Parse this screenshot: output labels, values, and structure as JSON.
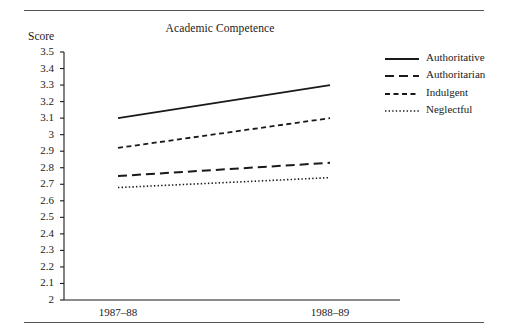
{
  "figure": {
    "title": "Academic Competence",
    "y_axis_name": "Score"
  },
  "chart_data": {
    "type": "line",
    "title": "Academic Competence",
    "xlabel": "",
    "ylabel": "Score",
    "categories": [
      "1987–88",
      "1988–89"
    ],
    "x": [
      0,
      1
    ],
    "ylim": [
      2,
      3.5
    ],
    "yticks": [
      "3.5",
      "3.4",
      "3.3",
      "3.2",
      "3.1",
      "3",
      "2.9",
      "2.8",
      "2.7",
      "2.6",
      "2.5",
      "2.4",
      "2.3",
      "2.2",
      "2.1",
      "2"
    ],
    "ytick_values": [
      3.5,
      3.4,
      3.3,
      3.2,
      3.1,
      3.0,
      2.9,
      2.8,
      2.7,
      2.6,
      2.5,
      2.4,
      2.3,
      2.2,
      2.1,
      2.0
    ],
    "grid": false,
    "legend_position": "right",
    "series": [
      {
        "name": "Authoritative",
        "values": [
          3.1,
          3.3
        ],
        "style": "solid",
        "color": "#1a1a1a"
      },
      {
        "name": "Authoritarian",
        "values": [
          2.75,
          2.83
        ],
        "style": "long-dash",
        "color": "#1a1a1a"
      },
      {
        "name": "Indulgent",
        "values": [
          2.92,
          3.1
        ],
        "style": "dash",
        "color": "#1a1a1a"
      },
      {
        "name": "Neglectful",
        "values": [
          2.68,
          2.74
        ],
        "style": "dotted",
        "color": "#1a1a1a"
      }
    ]
  },
  "legend": {
    "items": [
      {
        "label": "Authoritative"
      },
      {
        "label": "Authoritarian"
      },
      {
        "label": "Indulgent"
      },
      {
        "label": "Neglectful"
      }
    ]
  },
  "xtick_labels": [
    "1987–88",
    "1988–89"
  ]
}
